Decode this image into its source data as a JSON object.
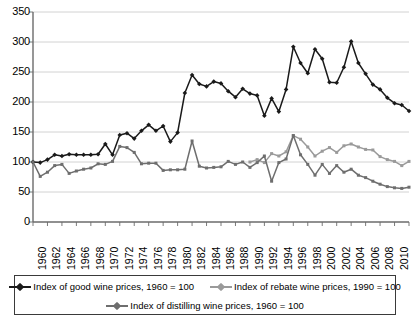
{
  "chart_data": {
    "type": "line",
    "title": "",
    "subtitle": "",
    "xlabel": "",
    "ylabel": "",
    "ylim": [
      0,
      350
    ],
    "ytick_step": 50,
    "yticks": [
      350,
      300,
      250,
      200,
      150,
      100,
      50,
      0
    ],
    "grid": "horizontal",
    "legend_position": "bottom",
    "x": [
      1960,
      1961,
      1962,
      1963,
      1964,
      1965,
      1966,
      1967,
      1968,
      1969,
      1970,
      1971,
      1972,
      1973,
      1974,
      1975,
      1976,
      1977,
      1978,
      1979,
      1980,
      1981,
      1982,
      1983,
      1984,
      1985,
      1986,
      1987,
      1988,
      1989,
      1990,
      1991,
      1992,
      1993,
      1994,
      1995,
      1996,
      1997,
      1998,
      1999,
      2000,
      2001,
      2002,
      2003,
      2004,
      2005,
      2006,
      2007,
      2008,
      2009,
      2010,
      2011,
      2012
    ],
    "xticks": [
      "1960",
      "1962",
      "1964",
      "1966",
      "1968",
      "1970",
      "1972",
      "1974",
      "1976",
      "1978",
      "1980",
      "1982",
      "1984",
      "1986",
      "1988",
      "1990",
      "1992",
      "1994",
      "1996",
      "1998",
      "2000",
      "2002",
      "2004",
      "2006",
      "2008",
      "2010",
      "2012"
    ],
    "series": [
      {
        "name": "Index of good wine prices, 1960 = 100",
        "key": "good-wine",
        "color": "#1a1a1a",
        "marker": "diamond",
        "start_year": 1960,
        "values": [
          100,
          99,
          104,
          112,
          110,
          113,
          112,
          112,
          112,
          113,
          130,
          112,
          145,
          148,
          139,
          152,
          162,
          152,
          160,
          134,
          149,
          215,
          245,
          230,
          226,
          234,
          231,
          218,
          208,
          222,
          214,
          211,
          177,
          206,
          184,
          221,
          292,
          265,
          248,
          288,
          272,
          233,
          232,
          258,
          301,
          265,
          247,
          229,
          221,
          207,
          198,
          195,
          185
        ]
      },
      {
        "name": "Index of rebate wine prices, 1990 = 100",
        "key": "rebate-wine",
        "color": "#9a9a9a",
        "marker": "square",
        "start_year": 1990,
        "values": [
          null,
          null,
          null,
          null,
          null,
          null,
          null,
          null,
          null,
          null,
          null,
          null,
          null,
          null,
          null,
          null,
          null,
          null,
          null,
          null,
          null,
          null,
          null,
          null,
          null,
          null,
          null,
          null,
          null,
          null,
          100,
          104,
          99,
          114,
          110,
          117,
          144,
          138,
          125,
          110,
          118,
          124,
          116,
          127,
          130,
          125,
          121,
          120,
          109,
          104,
          101,
          94,
          101
        ]
      },
      {
        "name": "Index of distilling wine prices, 1960 = 100",
        "key": "distilling-wine",
        "color": "#6e6e6e",
        "marker": "square",
        "start_year": 1960,
        "values": [
          100,
          76,
          83,
          94,
          96,
          81,
          85,
          88,
          90,
          97,
          96,
          101,
          126,
          124,
          116,
          97,
          98,
          98,
          86,
          87,
          87,
          88,
          135,
          93,
          90,
          91,
          92,
          101,
          96,
          100,
          91,
          99,
          110,
          68,
          99,
          105,
          144,
          112,
          96,
          78,
          96,
          81,
          94,
          83,
          88,
          78,
          74,
          68,
          63,
          59,
          57,
          56,
          58
        ]
      }
    ]
  },
  "legend": {
    "entries": [
      {
        "label": "Index of good wine prices, 1960 = 100"
      },
      {
        "label": "Index of rebate wine prices, 1990 = 100"
      },
      {
        "label": "Index of distilling wine prices, 1960 = 100"
      }
    ]
  }
}
